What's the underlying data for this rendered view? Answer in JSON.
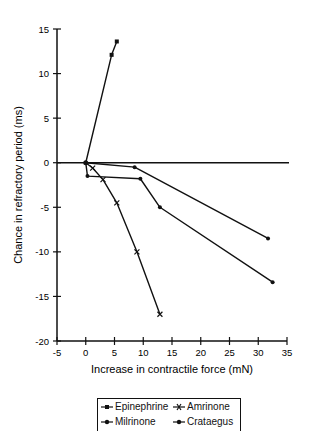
{
  "chart_data": {
    "type": "line",
    "title": "",
    "xlabel": "Increase in contractile force (mN)",
    "ylabel": "Chance in refractory period (ms)",
    "xlim": [
      -5,
      35
    ],
    "ylim": [
      -20,
      15
    ],
    "xticks": [
      -5,
      0,
      5,
      10,
      15,
      20,
      25,
      30,
      35
    ],
    "yticks": [
      15,
      10,
      5,
      0,
      -5,
      -10,
      -15,
      -20
    ],
    "grid": false,
    "reference_line_y0": true,
    "legend_position": "bottom",
    "series": [
      {
        "name": "Epinephrine",
        "marker": "square",
        "points": [
          [
            0,
            0
          ],
          [
            4.5,
            12.1
          ],
          [
            5.4,
            13.6
          ]
        ]
      },
      {
        "name": "Amrinone",
        "marker": "x",
        "points": [
          [
            0,
            0
          ],
          [
            1.2,
            -0.6
          ],
          [
            3.0,
            -1.9
          ],
          [
            5.4,
            -4.5
          ],
          [
            8.9,
            -10.0
          ],
          [
            12.9,
            -17.0
          ]
        ]
      },
      {
        "name": "Milrinone",
        "marker": "dot",
        "points": [
          [
            0,
            0
          ],
          [
            0.3,
            -1.5
          ],
          [
            9.5,
            -1.8
          ],
          [
            12.9,
            -5.0
          ],
          [
            32.5,
            -13.4
          ]
        ]
      },
      {
        "name": "Crataegus",
        "marker": "dot",
        "points": [
          [
            0,
            0
          ],
          [
            8.5,
            -0.5
          ],
          [
            31.7,
            -8.5
          ]
        ]
      }
    ]
  },
  "legend": {
    "items": [
      "Epinephrine",
      "Amrinone",
      "Milrinone",
      "Crataegus"
    ]
  }
}
